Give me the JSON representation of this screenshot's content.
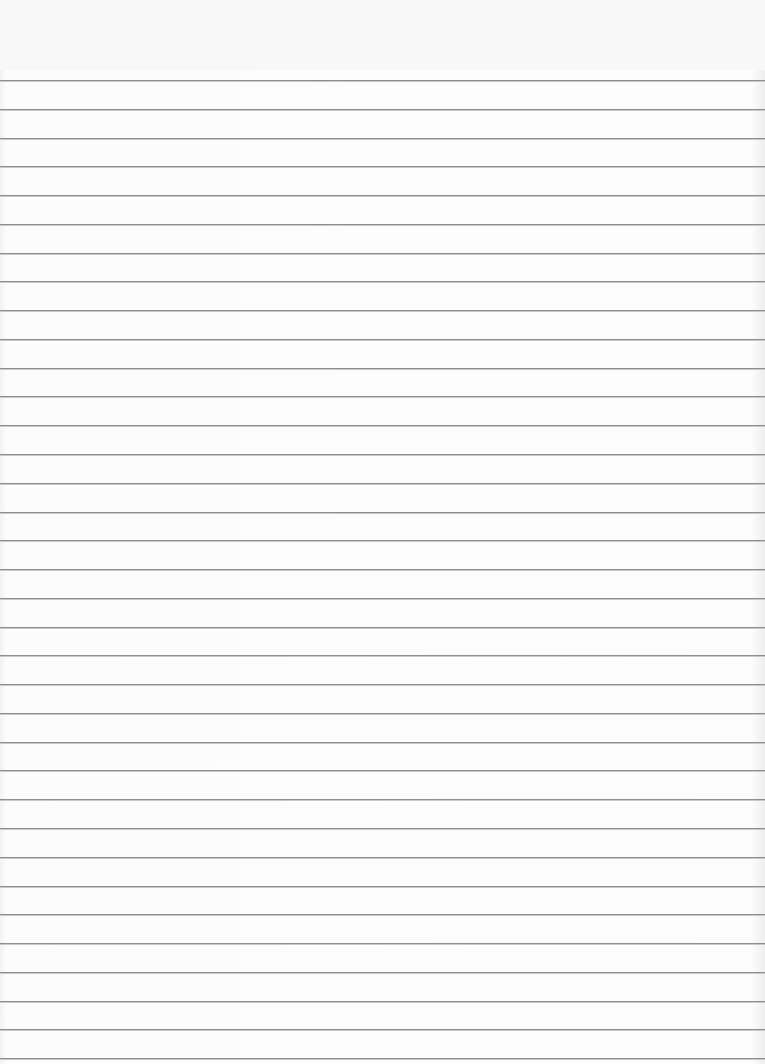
{
  "page": {
    "type": "lined-paper",
    "background_color": "#fbfbfb",
    "rule_color": "#8e8e8e",
    "rule_count": 35,
    "first_rule_y": 80,
    "rule_spacing": 28.77
  }
}
